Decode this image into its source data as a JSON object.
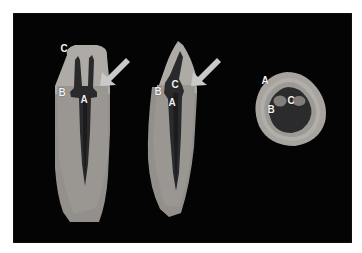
{
  "figure": {
    "background_color": "#ffffff",
    "field_color": "#040404",
    "label_color": "#f2f2f2",
    "arrow_color": "#c9c9c9"
  },
  "palette": {
    "enamel": "#ada9a6",
    "dentin": "#9a9793",
    "cementum": "#8d8a86",
    "pulp": "#2a2a2c",
    "pulp_inner": "#1e1e20",
    "canal_opening": "#7e7b78",
    "outline": "#6f6c69"
  },
  "specimens": [
    {
      "name": "longitudinal-section-left",
      "labels": [
        {
          "text": "C",
          "x": 64,
          "y": 49
        },
        {
          "text": "B",
          "x": 62,
          "y": 93
        },
        {
          "text": "A",
          "x": 84,
          "y": 100
        }
      ],
      "arrow": {
        "name": "cej-arrow-left",
        "x": 99,
        "y": 54
      }
    },
    {
      "name": "longitudinal-section-middle",
      "labels": [
        {
          "text": "B",
          "x": 158,
          "y": 92
        },
        {
          "text": "C",
          "x": 175,
          "y": 85
        },
        {
          "text": "A",
          "x": 172,
          "y": 103
        }
      ],
      "arrow": {
        "name": "cej-arrow-middle",
        "x": 190,
        "y": 54
      }
    },
    {
      "name": "cross-section-right",
      "labels": [
        {
          "text": "A",
          "x": 265,
          "y": 81
        },
        {
          "text": "B",
          "x": 271,
          "y": 110
        },
        {
          "text": "C",
          "x": 291,
          "y": 101
        }
      ],
      "arrow": null
    }
  ],
  "legend_letters": [
    "A",
    "B",
    "C"
  ]
}
